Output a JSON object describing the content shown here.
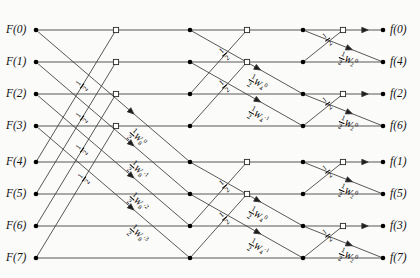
{
  "diagram": {
    "n_points": 8,
    "stages": 3
  },
  "inputs": [
    {
      "label": "F(0)",
      "row": 0
    },
    {
      "label": "F(1)",
      "row": 1
    },
    {
      "label": "F(2)",
      "row": 2
    },
    {
      "label": "F(3)",
      "row": 3
    },
    {
      "label": "F(4)",
      "row": 4
    },
    {
      "label": "F(5)",
      "row": 5
    },
    {
      "label": "F(6)",
      "row": 6
    },
    {
      "label": "F(7)",
      "row": 7
    }
  ],
  "outputs": [
    {
      "label": "f(0)",
      "row": 0
    },
    {
      "label": "f(4)",
      "row": 1
    },
    {
      "label": "f(2)",
      "row": 2
    },
    {
      "label": "f(6)",
      "row": 3
    },
    {
      "label": "f(1)",
      "row": 4
    },
    {
      "label": "f(5)",
      "row": 5
    },
    {
      "label": "f(3)",
      "row": 6
    },
    {
      "label": "f(7)",
      "row": 7
    }
  ],
  "weights": {
    "stage1": [
      {
        "coef": "1/2",
        "sym": "W",
        "sub": "8",
        "sup": "0",
        "text": "1/2 W8^0"
      },
      {
        "coef": "1/2",
        "sym": "W",
        "sub": "8",
        "sup": "-1",
        "text": "1/2 W8^-1"
      },
      {
        "coef": "1/2",
        "sym": "W",
        "sub": "8",
        "sup": "-2",
        "text": "1/2 W8^-2"
      },
      {
        "coef": "1/2",
        "sym": "W",
        "sub": "8",
        "sup": "-3",
        "text": "1/2 W8^-3"
      }
    ],
    "stage2": [
      {
        "coef": "1/2",
        "sym": "W",
        "sub": "4",
        "sup": "0",
        "text": "1/2 W4^0"
      },
      {
        "coef": "1/2",
        "sym": "W",
        "sub": "4",
        "sup": "-1",
        "text": "1/2 W4^-1"
      }
    ],
    "stage3": [
      {
        "coef": "1/2",
        "sym": "W",
        "sub": "2",
        "sup": "0",
        "text": "1/2 W2^0"
      }
    ],
    "plain": {
      "coef": "1/2",
      "text": "1/2"
    }
  },
  "geometry": {
    "col_x": [
      36,
      116,
      190,
      247,
      303,
      343,
      383
    ],
    "row_y": [
      30,
      62,
      94,
      126,
      162,
      194,
      226,
      258
    ],
    "row_step": 32.5
  },
  "edges_note": "Stage 1: rows i and i+4 cross into node column 1 (open squares rows 0-3) and weighted nodes column 2 (rows 4-7). Stage 2: pairs within each half of 4. Stage 3: adjacent pairs.",
  "colors": {
    "line": "#3a3a3a",
    "node_fill": "#000000",
    "node_open_fill": "#ffffff",
    "background": "#fbfbfa",
    "text": "#111111"
  }
}
